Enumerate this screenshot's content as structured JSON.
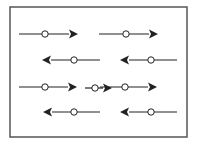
{
  "diagram": {
    "colors": {
      "background": "#ffffff",
      "frame": "#555555",
      "arrow": "#222222",
      "circle_fill": "#ffffff"
    },
    "frame": {
      "x": 10,
      "y": 7,
      "width": 177,
      "height": 130
    },
    "arrows": [
      {
        "id": "r1a",
        "row": 1,
        "direction": "right",
        "x1": 19,
        "x2": 78,
        "y": 34,
        "circle_x": 45
      },
      {
        "id": "r1b",
        "row": 1,
        "direction": "right",
        "x1": 99,
        "x2": 158,
        "y": 34,
        "circle_x": 126
      },
      {
        "id": "r2a",
        "row": 2,
        "direction": "left",
        "x1": 42,
        "x2": 100,
        "y": 60,
        "circle_x": 74
      },
      {
        "id": "r2b",
        "row": 2,
        "direction": "left",
        "x1": 120,
        "x2": 177,
        "y": 60,
        "circle_x": 151
      },
      {
        "id": "r3a",
        "row": 3,
        "direction": "right",
        "x1": 19,
        "x2": 77,
        "y": 87,
        "circle_x": 45
      },
      {
        "id": "r3b",
        "row": 3,
        "direction": "right",
        "x1": 85,
        "x2": 112,
        "y": 88,
        "circle_x": 95
      },
      {
        "id": "r3c",
        "row": 3,
        "direction": "right",
        "x1": 100,
        "x2": 157,
        "y": 87,
        "circle_x": 125
      },
      {
        "id": "r4a",
        "row": 4,
        "direction": "left",
        "x1": 43,
        "x2": 100,
        "y": 112,
        "circle_x": 74
      },
      {
        "id": "r4b",
        "row": 4,
        "direction": "left",
        "x1": 120,
        "x2": 177,
        "y": 112,
        "circle_x": 151
      }
    ]
  }
}
